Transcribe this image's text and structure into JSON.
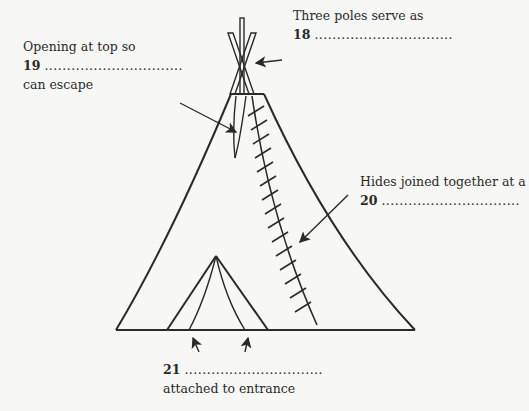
{
  "diagram": {
    "labels": [
      {
        "id": "poles",
        "line1": "Three poles serve as",
        "number": "18",
        "blank": "...............................",
        "line3": ""
      },
      {
        "id": "opening",
        "line1": "Opening at top so",
        "number": "19",
        "blank": "...............................",
        "line3": "can escape"
      },
      {
        "id": "hides",
        "line1": "Hides joined together at a",
        "number": "20",
        "blank": "...............................",
        "line3": ""
      },
      {
        "id": "entrance",
        "line1": "",
        "number": "21",
        "blank": "...............................",
        "line3": "attached to entrance"
      }
    ],
    "colors": {
      "ink": "#2a2a2a",
      "background": "#f7f7f5"
    }
  }
}
